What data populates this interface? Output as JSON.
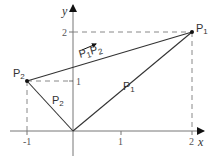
{
  "diagram": {
    "axes": {
      "x_label": "x",
      "y_label": "y",
      "x_ticks": [
        {
          "value": -1,
          "label": "-1"
        },
        {
          "value": 1,
          "label": "1"
        },
        {
          "value": 2,
          "label": "2"
        }
      ],
      "y_ticks": [
        {
          "value": 1,
          "label": "1"
        },
        {
          "value": 2,
          "label": "2"
        }
      ]
    },
    "points": {
      "p1": {
        "label_main": "P",
        "label_sub": "1",
        "x": 2,
        "y": 2
      },
      "p2": {
        "label_main": "P",
        "label_sub": "2",
        "x": -1,
        "y": 1
      }
    },
    "vectors": {
      "op1": {
        "label_main": "P",
        "label_sub": "1"
      },
      "op2": {
        "label_main": "P",
        "label_sub": "2"
      },
      "p1p2": {
        "label_a_main": "P",
        "label_a_sub": "1",
        "label_b_main": "P",
        "label_b_sub": "2"
      }
    },
    "colors": {
      "line": "#333333",
      "axis": "#777777",
      "dashed": "#888888",
      "point": "#111111"
    }
  }
}
